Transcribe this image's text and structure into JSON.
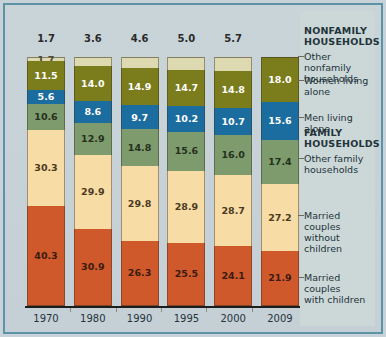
{
  "chart_data": {
    "type": "bar",
    "subtype": "stacked-100-percent",
    "title": "",
    "xlabel": "",
    "ylabel": "",
    "categories": [
      "1970",
      "1980",
      "1990",
      "1995",
      "2000",
      "2009"
    ],
    "series": [
      {
        "name": "Other nonfamily households",
        "color": "#ddd9b0",
        "values": [
          1.7,
          3.6,
          4.6,
          5.0,
          5.7,
          null
        ]
      },
      {
        "name": "Women living alone",
        "color": "#7b7c1c",
        "values": [
          11.5,
          14.0,
          14.9,
          14.7,
          14.8,
          18.0
        ]
      },
      {
        "name": "Men living alone",
        "color": "#1a6d9e",
        "values": [
          5.6,
          8.6,
          9.7,
          10.2,
          10.7,
          15.6
        ]
      },
      {
        "name": "Other family households",
        "color": "#7d9b6c",
        "values": [
          10.6,
          12.9,
          14.8,
          15.6,
          16.0,
          17.4
        ]
      },
      {
        "name": "Married couples without children",
        "color": "#f8dca6",
        "values": [
          30.3,
          29.9,
          29.8,
          28.9,
          28.7,
          27.2
        ]
      },
      {
        "name": "Married couples with children",
        "color": "#d0592c",
        "values": [
          40.3,
          30.9,
          26.3,
          25.5,
          24.1,
          21.9
        ]
      }
    ],
    "group_labels": [
      "NONFAMILY HOUSEHOLDS",
      "FAMILY HOUSEHOLDS"
    ],
    "ylim": [
      0,
      100
    ],
    "grid": false,
    "legend_position": "right"
  },
  "top_totals": [
    "1.7",
    "3.6",
    "4.6",
    "5.0",
    "5.7",
    ""
  ],
  "years": [
    "1970",
    "1980",
    "1990",
    "1995",
    "2000",
    "2009"
  ],
  "bars": [
    {
      "year": "1970",
      "segments": [
        {
          "key": "nonfam",
          "label": "1.7",
          "value": 1.7
        },
        {
          "key": "women",
          "label": "11.5",
          "value": 11.5
        },
        {
          "key": "men",
          "label": "5.6",
          "value": 5.6
        },
        {
          "key": "otherfam",
          "label": "10.6",
          "value": 10.6
        },
        {
          "key": "marrwo",
          "label": "30.3",
          "value": 30.3
        },
        {
          "key": "marrw",
          "label": "40.3",
          "value": 40.3
        }
      ]
    },
    {
      "year": "1980",
      "segments": [
        {
          "key": "nonfam",
          "label": "",
          "value": 3.6
        },
        {
          "key": "women",
          "label": "14.0",
          "value": 14.0
        },
        {
          "key": "men",
          "label": "8.6",
          "value": 8.6
        },
        {
          "key": "otherfam",
          "label": "12.9",
          "value": 12.9
        },
        {
          "key": "marrwo",
          "label": "29.9",
          "value": 29.9
        },
        {
          "key": "marrw",
          "label": "30.9",
          "value": 30.9
        }
      ]
    },
    {
      "year": "1990",
      "segments": [
        {
          "key": "nonfam",
          "label": "",
          "value": 4.6
        },
        {
          "key": "women",
          "label": "14.9",
          "value": 14.9
        },
        {
          "key": "men",
          "label": "9.7",
          "value": 9.7
        },
        {
          "key": "otherfam",
          "label": "14.8",
          "value": 14.8
        },
        {
          "key": "marrwo",
          "label": "29.8",
          "value": 29.8
        },
        {
          "key": "marrw",
          "label": "26.3",
          "value": 26.3
        }
      ]
    },
    {
      "year": "1995",
      "segments": [
        {
          "key": "nonfam",
          "label": "",
          "value": 5.0
        },
        {
          "key": "women",
          "label": "14.7",
          "value": 14.7
        },
        {
          "key": "men",
          "label": "10.2",
          "value": 10.2
        },
        {
          "key": "otherfam",
          "label": "15.6",
          "value": 15.6
        },
        {
          "key": "marrwo",
          "label": "28.9",
          "value": 28.9
        },
        {
          "key": "marrw",
          "label": "25.5",
          "value": 25.5
        }
      ]
    },
    {
      "year": "2000",
      "segments": [
        {
          "key": "nonfam",
          "label": "",
          "value": 5.7
        },
        {
          "key": "women",
          "label": "14.8",
          "value": 14.8
        },
        {
          "key": "men",
          "label": "10.7",
          "value": 10.7
        },
        {
          "key": "otherfam",
          "label": "16.0",
          "value": 16.0
        },
        {
          "key": "marrwo",
          "label": "28.7",
          "value": 28.7
        },
        {
          "key": "marrw",
          "label": "24.1",
          "value": 24.1
        }
      ]
    },
    {
      "year": "2009",
      "segments": [
        {
          "key": "women",
          "label": "18.0",
          "value": 18.0
        },
        {
          "key": "men",
          "label": "15.6",
          "value": 15.6
        },
        {
          "key": "otherfam",
          "label": "17.4",
          "value": 17.4
        },
        {
          "key": "marrwo",
          "label": "27.2",
          "value": 27.2
        },
        {
          "key": "marrw",
          "label": "21.9",
          "value": 21.9
        }
      ]
    }
  ],
  "legend": {
    "entries": [
      {
        "id": "nonfamily-households-header",
        "text": "NONFAMILY\nHOUSEHOLDS",
        "type": "header",
        "top": 14
      },
      {
        "id": "other-nonfamily-households",
        "text": "Other nonfamily\nhouseholds",
        "type": "item",
        "top": 40
      },
      {
        "id": "women-living-alone",
        "text": "Women living\nalone",
        "type": "item",
        "top": 64
      },
      {
        "id": "men-living-alone",
        "text": "Men living alone",
        "type": "item",
        "top": 101
      },
      {
        "id": "family-households-header",
        "text": "FAMILY\nHOUSEHOLDS",
        "type": "header",
        "top": 116
      },
      {
        "id": "other-family-households",
        "text": "Other family\nhouseholds",
        "type": "item",
        "top": 142
      },
      {
        "id": "married-couples-without-children",
        "text": "Married couples\nwithout children",
        "type": "item",
        "top": 199
      },
      {
        "id": "married-couples-with-children",
        "text": "Married couples\nwith children",
        "type": "item",
        "top": 261
      }
    ]
  },
  "colors": {
    "frame": "#5d93a6",
    "page_bg": "#c7d3d8",
    "legend_bg": "#ccd8d8",
    "other_nonfamily": "#ddd9b0",
    "women_alone": "#7b7c1c",
    "men_alone": "#1a6d9e",
    "other_family": "#7d9b6c",
    "married_without": "#f8dca6",
    "married_with": "#d0592c",
    "axis": "#1d1d1d",
    "text": "#23333a"
  }
}
